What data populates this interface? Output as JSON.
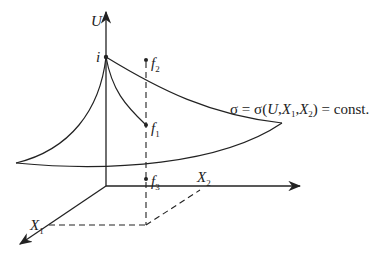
{
  "diagram": {
    "axes": {
      "vertical": "U",
      "horizontal": "X",
      "horizontal_sub": "2",
      "depth": "X",
      "depth_sub": "1"
    },
    "points": {
      "i": "i",
      "f1": "f",
      "f1_sub": "1",
      "f2": "f",
      "f2_sub": "2",
      "f3": "f",
      "f3_sub": "3"
    },
    "equation": {
      "sigma": "σ = σ(",
      "U": "U",
      "sep1": ",",
      "X1": "X",
      "X1_sub": "1",
      "sep2": ",",
      "X2": "X",
      "X2_sub": "2",
      "tail": ") = const."
    },
    "colors": {
      "line": "#222222",
      "background": "#ffffff"
    }
  }
}
